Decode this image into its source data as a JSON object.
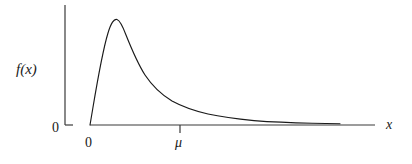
{
  "figure": {
    "background_color": "#ffffff",
    "ink_color": "#1a1a1a",
    "width": 412,
    "height": 164
  },
  "labels": {
    "y_axis": "f(x)",
    "x_axis": "x",
    "origin_y": "0",
    "origin_x": "0",
    "mean_tick": "μ"
  },
  "chart_data": {
    "type": "line",
    "title": "",
    "subtitle": "",
    "xlabel": "x",
    "ylabel": "f(x)",
    "grid": false,
    "legend": null,
    "xlim": [
      0,
      10.0
    ],
    "ylim": [
      0,
      1.15
    ],
    "xticks": [
      0,
      2.0
    ],
    "xticklabels": [
      "0",
      "μ"
    ],
    "yticks": [
      0
    ],
    "yticklabels": [
      "0"
    ],
    "annotations": [
      {
        "text": "μ",
        "x": 2.0,
        "y": 0,
        "note": "mean marked by tick below x-axis"
      },
      {
        "text": "0",
        "x": 0,
        "y": 0,
        "note": "origin label below x-axis"
      },
      {
        "text": "0",
        "x": 0,
        "y": 0,
        "note": "zero label left of y-axis base"
      }
    ],
    "series": [
      {
        "name": "f(x)",
        "color": "#1a1a1a",
        "x": [
          0.0,
          0.1,
          0.2,
          0.3,
          0.4,
          0.5,
          0.6,
          0.7,
          0.8,
          0.9,
          1.0,
          1.2,
          1.4,
          1.6,
          1.8,
          2.0,
          2.25,
          2.5,
          2.75,
          3.0,
          3.5,
          4.0,
          4.5,
          5.0,
          5.5,
          6.0,
          6.5,
          7.0,
          7.5,
          8.0,
          8.75
        ],
        "y": [
          0.0,
          0.45,
          0.78,
          0.95,
          1.01,
          1.0,
          0.96,
          0.9,
          0.84,
          0.78,
          0.72,
          0.61,
          0.52,
          0.44,
          0.37,
          0.31,
          0.26,
          0.21,
          0.18,
          0.15,
          0.11,
          0.085,
          0.066,
          0.052,
          0.042,
          0.035,
          0.029,
          0.024,
          0.02,
          0.017,
          0.013
        ]
      }
    ]
  },
  "geometry": {
    "y_axis": {
      "x": 65,
      "y_top": 5,
      "y_bottom": 125,
      "tick_len": 8
    },
    "x_axis": {
      "y": 125,
      "x_left": 90,
      "x_right": 375
    },
    "mu_tick": {
      "x": 180,
      "len": 8
    },
    "curve_path": "M 90,125 C 95,96 101,56 108,33 C 111,23 114,18.5 117,19.5 C 120,20.5 123,27 126,35 C 132,50 138,64 145,75 C 153,87 162,95 172,101 C 183,107 195,111 208,114 C 222,117 238,119 254,120.6 C 272,122 292,122.8 312,123.2 C 325,123.45 333,123.6 340,123.7"
  }
}
